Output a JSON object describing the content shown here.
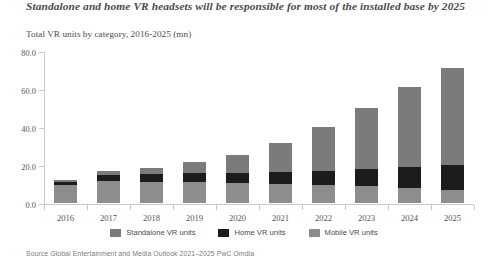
{
  "header": {
    "title": "Standalone and home VR headsets will be responsible for most of the installed base by 2025",
    "subtitle": "Total VR units by category, 2016-2025 (mn)"
  },
  "source": {
    "text": "Source  Global Entertainment and Media Outlook 2021–2025  PwC  Omdia"
  },
  "colors": {
    "standalone": "#7b7b7b",
    "home": "#1c1c1c",
    "mobile": "#8d8d8d",
    "axis": "#c9c9cc",
    "title_text": "#4a4a52",
    "body_text": "#55555b"
  },
  "legend": {
    "position": "bottom-center",
    "entries": [
      {
        "label": "Standalone VR units",
        "color": "#7b7b7b",
        "swatch": "legend-swatch-standalone"
      },
      {
        "label": "Home VR units",
        "color": "#1c1c1c",
        "swatch": "legend-swatch-home"
      },
      {
        "label": "Mobile VR units",
        "color": "#8d8d8d",
        "swatch": "legend-swatch-mobile"
      }
    ]
  },
  "chart_data": {
    "type": "bar",
    "subtype": "stacked-vertical",
    "title": "Standalone and home VR headsets will be responsible for most of the installed base by 2025",
    "subtitle": "Total VR units by category, 2016-2025 (mn)",
    "xlabel": "",
    "ylabel": "",
    "units": "mn",
    "categories": [
      "2016",
      "2017",
      "2018",
      "2019",
      "2020",
      "2021",
      "2022",
      "2023",
      "2024",
      "2025"
    ],
    "stack_order_bottom_to_top": [
      "Mobile VR units",
      "Home VR units",
      "Standalone VR units"
    ],
    "series": [
      {
        "name": "Mobile VR units",
        "color": "#8d8d8d",
        "values": [
          9.5,
          11.5,
          11.0,
          11.0,
          10.5,
          10.0,
          9.5,
          9.0,
          8.0,
          7.0
        ]
      },
      {
        "name": "Home VR units",
        "color": "#1c1c1c",
        "values": [
          1.5,
          3.5,
          4.5,
          5.0,
          5.5,
          6.5,
          7.5,
          9.0,
          11.0,
          13.0
        ]
      },
      {
        "name": "Standalone VR units",
        "color": "#7b7b7b",
        "values": [
          1.0,
          2.0,
          3.0,
          5.5,
          9.5,
          15.0,
          23.0,
          32.0,
          42.0,
          51.0
        ]
      }
    ],
    "totals": [
      12.0,
      17.0,
      18.5,
      21.5,
      25.5,
      31.5,
      40.0,
      50.0,
      61.0,
      71.0
    ],
    "ylim": [
      0,
      80
    ],
    "yticks": [
      "0.0",
      "20.0",
      "40.0",
      "60.0",
      "80.0"
    ],
    "ytick_values": [
      0,
      20,
      40,
      60,
      80
    ],
    "grid": false,
    "legend_position": "bottom"
  }
}
